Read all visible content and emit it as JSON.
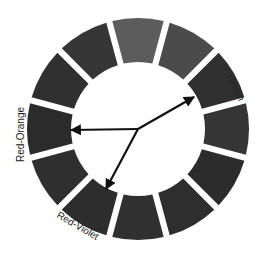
{
  "diagram": {
    "type": "color-wheel",
    "center": [
      138,
      129
    ],
    "outer_radius": 111,
    "inner_radius": 67,
    "segment_count": 12,
    "segments": [
      {
        "angle": 90,
        "shade": "#5c5c5c"
      },
      {
        "angle": 60,
        "shade": "#4b4b4b"
      },
      {
        "angle": 30,
        "shade": "#303030"
      },
      {
        "angle": 0,
        "shade": "#353535"
      },
      {
        "angle": -30,
        "shade": "#2c2c2c"
      },
      {
        "angle": -60,
        "shade": "#2e2e2e"
      },
      {
        "angle": -90,
        "shade": "#303030"
      },
      {
        "angle": -120,
        "shade": "#2d2d2d"
      },
      {
        "angle": -150,
        "shade": "#2f2f2f"
      },
      {
        "angle": 180,
        "shade": "#2b2b2b"
      },
      {
        "angle": 150,
        "shade": "#303030"
      },
      {
        "angle": 120,
        "shade": "#363636"
      }
    ],
    "arrows": [
      {
        "target": "Green",
        "to": [
          194,
          97
        ]
      },
      {
        "target": "Red-Orange",
        "to": [
          71,
          130
        ]
      },
      {
        "target": "Red-Violet",
        "to": [
          106,
          189
        ]
      }
    ],
    "labels": {
      "green": "Green",
      "red_orange": "Red-Orange",
      "red_violet": "Red-Violet"
    }
  }
}
